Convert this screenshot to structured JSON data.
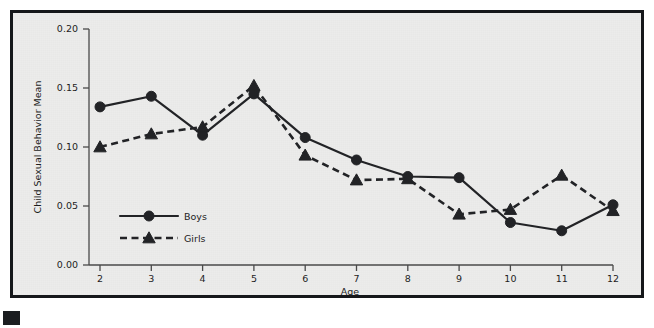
{
  "chart_data": {
    "type": "line",
    "title": "",
    "xlabel": "Age",
    "ylabel": "Child Sexual Behavior Mean",
    "x": [
      2,
      3,
      4,
      5,
      6,
      7,
      8,
      9,
      10,
      11,
      12
    ],
    "xtick_labels": [
      "2",
      "3",
      "4",
      "5",
      "6",
      "7",
      "8",
      "9",
      "10",
      "11",
      "12"
    ],
    "ytick_labels": [
      "0.00",
      "0.05",
      "0.10",
      "0.15",
      "0.20"
    ],
    "ytick_values": [
      0.0,
      0.05,
      0.1,
      0.15,
      0.2
    ],
    "ylim": [
      0.0,
      0.2
    ],
    "xlim": [
      2,
      12
    ],
    "grid": false,
    "legend_position": "inside-lower-left",
    "series": [
      {
        "name": "Boys",
        "marker": "circle",
        "linestyle": "solid",
        "color": "#222326",
        "values": [
          0.134,
          0.143,
          0.11,
          0.145,
          0.108,
          0.089,
          0.075,
          0.074,
          0.036,
          0.029,
          0.051
        ]
      },
      {
        "name": "Girls",
        "marker": "triangle",
        "linestyle": "dashed",
        "color": "#222326",
        "values": [
          0.1,
          0.111,
          0.117,
          0.152,
          0.093,
          0.072,
          0.073,
          0.043,
          0.047,
          0.076,
          0.046
        ]
      }
    ]
  },
  "legend": {
    "items": [
      {
        "label": "Boys"
      },
      {
        "label": "Girls"
      }
    ]
  },
  "figure": {
    "background_color": "#ececeb",
    "border_color": "#15171a",
    "ink_color": "#222326"
  }
}
